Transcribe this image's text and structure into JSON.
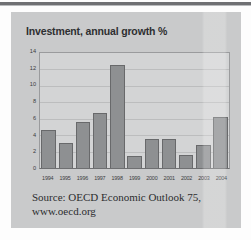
{
  "page": {
    "background_color": "#fdfdfd",
    "panel_color": "#c9cacb",
    "rule_color": "#6f7073"
  },
  "chart_data": {
    "type": "bar",
    "title": "Investment, annual growth %",
    "xlabel": "",
    "ylabel": "",
    "ylim": [
      0,
      14
    ],
    "yticks": [
      0,
      2,
      4,
      6,
      8,
      10,
      12,
      14
    ],
    "grid": true,
    "legend": false,
    "bar_color": "#8e9092",
    "bar_border_color": "#68696b",
    "plot_background": "#d3d4d5",
    "categories": [
      "1994",
      "1995",
      "1996",
      "1997",
      "1998",
      "1999",
      "2000",
      "2001",
      "2002",
      "2003",
      "2004"
    ],
    "values": [
      4.6,
      3.1,
      5.6,
      6.7,
      12.5,
      1.5,
      3.5,
      3.5,
      1.6,
      2.8,
      6.2
    ],
    "annotations": [
      "Source: OECD Economic Outlook 75,",
      "www.oecd.org"
    ]
  },
  "source": {
    "line1": "Source: OECD Economic Outlook 75,",
    "line2": "www.oecd.org"
  }
}
